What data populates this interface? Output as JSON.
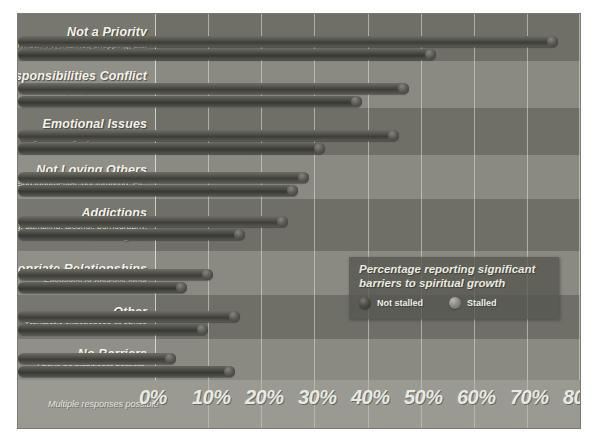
{
  "chart_data": {
    "type": "bar",
    "orientation": "horizontal",
    "title": "Percentage reporting significant barriers to spiritual growth",
    "xlabel": "",
    "ylabel": "",
    "xlim": [
      0,
      80
    ],
    "grid": true,
    "legend_position": "inside-right",
    "footnote": "Multiple responses possible",
    "tick_labels": [
      "0%",
      "10%",
      "20%",
      "30%",
      "40%",
      "50%",
      "60%",
      "70%",
      "80%"
    ],
    "tick_values": [
      0,
      10,
      20,
      30,
      40,
      50,
      60,
      70,
      80
    ],
    "categories": [
      "Not a Priority",
      "Responsibilities Conflict",
      "Emotional Issues",
      "Not Loving Others",
      "Addictions",
      "Inappropriate Relationships",
      "Other",
      "No Barriers"
    ],
    "category_subtitles": [
      "Too much TV, Internet, shopping, etc.",
      "Job demands, travel, family responsibilities, etc.",
      "Depression, anger, stuffing my emotions, etc.",
      "Gossip, being judgmental, not forgiving, etc.",
      "Out-of-control spending, gambling, alcohol, pornography, overeating, etc.",
      "Emotional or physical affair",
      "Traumatic experiences or abuse",
      "I have no significant barriers."
    ],
    "series": [
      {
        "name": "Not stalled",
        "values": [
          76,
          48,
          46,
          29,
          25,
          11,
          16,
          4
        ]
      },
      {
        "name": "Stalled",
        "values": [
          53,
          39,
          32,
          27,
          17,
          6,
          10,
          15
        ]
      }
    ]
  },
  "legend": {
    "title_line1": "Percentage reporting significant",
    "title_line2": "barriers to spiritual growth",
    "items": [
      {
        "label": "Not stalled",
        "marker": "sphere-dark-icon"
      },
      {
        "label": "Stalled",
        "marker": "sphere-light-icon"
      }
    ]
  },
  "colors": {
    "plate_background": "#8e8e86",
    "band_dark": "#6f6f68",
    "band_light": "#8a8a82",
    "axis_strip": "#9a9a92",
    "gridline": "#e2e2d8",
    "text_primary": "#f2f2ec",
    "text_secondary": "#e6e6de",
    "series_not_stalled": "#4e4e47",
    "series_stalled": "#8d8d84",
    "legend_background": "#56564f"
  }
}
